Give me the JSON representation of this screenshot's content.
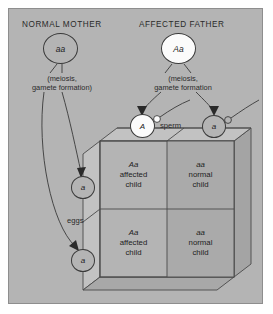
{
  "figure": {
    "panel_bg": "#b4b4b4",
    "headers": {
      "mother": "NORMAL MOTHER",
      "father": "AFFECTED FATHER"
    },
    "parents": [
      {
        "id": "mother",
        "genotype": "aa",
        "fill": "#b4b4b4"
      },
      {
        "id": "father",
        "genotype": "Aa",
        "fill": "#fbfbfb"
      }
    ],
    "meiosis_notes": {
      "mother": "(meiosis,\ngamete formation)",
      "father": "(meiosis,\ngamete formation"
    },
    "gamete_labels": {
      "sperm": "sperm",
      "eggs": "eggs"
    },
    "sperm_gametes": [
      {
        "allele": "A",
        "fill": "#fbfbfb"
      },
      {
        "allele": "a",
        "fill": "#b4b4b4"
      }
    ],
    "egg_gametes": [
      {
        "allele": "a",
        "fill": "#b4b4b4"
      },
      {
        "allele": "a",
        "fill": "#b4b4b4"
      }
    ],
    "punnett": {
      "cells": [
        {
          "genotype": "Aa",
          "line1": "affected",
          "line2": "child"
        },
        {
          "genotype": "aa",
          "line1": "normal",
          "line2": "child"
        },
        {
          "genotype": "Aa",
          "line1": "affected",
          "line2": "child"
        },
        {
          "genotype": "aa",
          "line1": "normal",
          "line2": "child"
        }
      ]
    }
  }
}
